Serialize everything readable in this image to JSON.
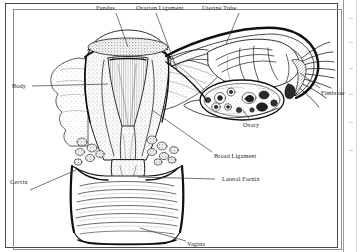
{
  "figure": {
    "kind": "anatomical-line-drawing",
    "style": "black-and-white engraving / stipple hatching",
    "background_color": "#ffffff",
    "ink_color": "#1a1a1a",
    "frame_color": "#4a4a4a"
  },
  "labels": {
    "fundus": "Fundus",
    "ovarian_ligament": "Ovarian Ligament",
    "uterine_tube": "Uterine Tube",
    "fimbriae": "Fimbriae",
    "ovary": "Ovary",
    "broad_ligament": "Broad Ligament",
    "lateral_fornix": "Lateral Fornix",
    "body": "Body",
    "cervix": "Cervix",
    "vagina": "Vagina"
  },
  "structures": [
    {
      "name": "Fundus",
      "side": "top-center"
    },
    {
      "name": "Ovarian Ligament",
      "side": "top-center"
    },
    {
      "name": "Uterine Tube",
      "side": "top-right"
    },
    {
      "name": "Fimbriae",
      "side": "right"
    },
    {
      "name": "Ovary",
      "side": "right"
    },
    {
      "name": "Broad Ligament",
      "side": "right"
    },
    {
      "name": "Lateral Fornix",
      "side": "right"
    },
    {
      "name": "Body",
      "side": "left"
    },
    {
      "name": "Cervix",
      "side": "left"
    },
    {
      "name": "Vagina",
      "side": "bottom-center"
    }
  ]
}
